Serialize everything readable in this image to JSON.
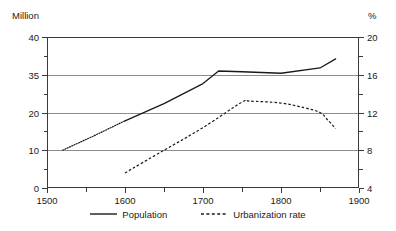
{
  "chart_data": {
    "type": "line",
    "title": "",
    "xlabel": "",
    "ylabel": "Million",
    "y2label": "%",
    "xlim": [
      1500,
      1900
    ],
    "ylim": [
      0,
      40
    ],
    "y2lim": [
      4,
      20
    ],
    "grid": true,
    "legend_position": "bottom-center",
    "x_ticks": [
      1500,
      1600,
      1700,
      1800,
      1900
    ],
    "x_ticks_minor": [
      1550,
      1650,
      1750,
      1850
    ],
    "y_ticks": [
      40,
      35,
      20,
      10,
      0
    ],
    "y2_ticks": [
      20,
      16,
      12,
      8,
      4
    ],
    "series": [
      {
        "name": "Population",
        "axis": "left",
        "style": "solid",
        "color": "#1a1a1a",
        "note": "leading 1520-1600 segment drawn dotted",
        "x": [
          1520,
          1560,
          1600,
          1650,
          1700,
          1720,
          1750,
          1800,
          1850,
          1870
        ],
        "values": [
          10.0,
          13.8,
          17.8,
          23.5,
          31.5,
          35.5,
          35.4,
          35.2,
          35.9,
          37.1
        ]
      },
      {
        "name": "Urbanization rate",
        "axis": "right",
        "style": "dashed",
        "color": "#1a1a1a",
        "x": [
          1600,
          1650,
          1700,
          1750,
          1760,
          1800,
          1830,
          1850,
          1860,
          1870
        ],
        "values": [
          5.6,
          8.0,
          10.4,
          13.1,
          13.2,
          13.0,
          12.5,
          12.0,
          11.2,
          10.3
        ]
      }
    ]
  },
  "axes": {
    "left_unit": "Million",
    "right_unit": "%",
    "x_tick_labels": [
      "1500",
      "1600",
      "1700",
      "1800",
      "1900"
    ],
    "y_tick_labels": [
      "40",
      "35",
      "20",
      "10",
      "0"
    ],
    "y2_tick_labels": [
      "20",
      "16",
      "12",
      "8",
      "4"
    ]
  },
  "legend": {
    "items": [
      {
        "label": "Population",
        "style": "solid"
      },
      {
        "label": "Urbanization rate",
        "style": "dashed"
      }
    ]
  }
}
